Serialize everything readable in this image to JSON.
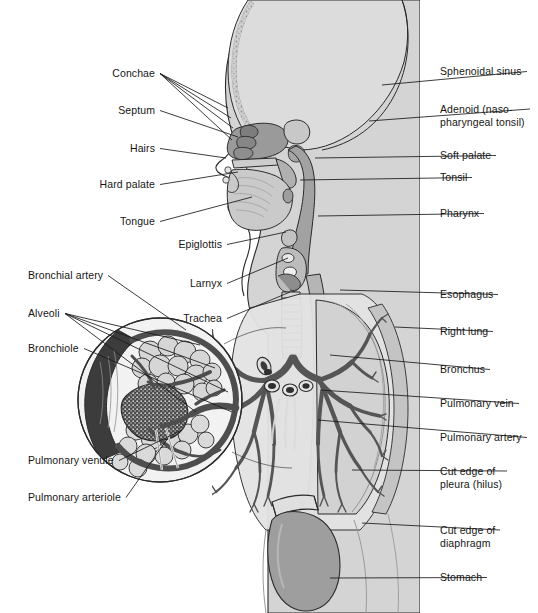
{
  "figure": {
    "background_color": "#ffffff",
    "ink_color": "#1a1a1a",
    "tissue_light": "#dcdcdc",
    "tissue_mid": "#b8b8b8",
    "tissue_dark": "#8e8e8e",
    "vessel_dark": "#5f5f5f",
    "outline_color": "#2b2b2b"
  },
  "labels_left": [
    {
      "text": "Conchae",
      "align": "right",
      "x": 155,
      "y": 76,
      "tip_x": 218,
      "tip_y": 120,
      "tips": [
        [
          228,
          108
        ],
        [
          231,
          118
        ],
        [
          233,
          128
        ],
        [
          232,
          140
        ]
      ]
    },
    {
      "text": "Septum",
      "align": "right",
      "x": 155,
      "y": 113,
      "tip_x": 226,
      "tip_y": 133,
      "tips": [
        [
          238,
          137
        ]
      ]
    },
    {
      "text": "Hairs",
      "align": "right",
      "x": 155,
      "y": 151,
      "tip_x": 232,
      "tip_y": 156,
      "tips": [
        [
          226,
          158
        ]
      ]
    },
    {
      "text": "Hard palate",
      "align": "right",
      "x": 155,
      "y": 187,
      "tip_x": 214,
      "tip_y": 189,
      "tips": [
        [
          238,
          172
        ]
      ]
    },
    {
      "text": "Tongue",
      "align": "right",
      "x": 155,
      "y": 224,
      "tip_x": 214,
      "tip_y": 221,
      "tips": [
        [
          252,
          197
        ]
      ]
    }
  ],
  "labels_inner": [
    {
      "text": "Epiglottis",
      "align": "right",
      "x": 222,
      "y": 247,
      "tips": [
        [
          286,
          232
        ]
      ]
    },
    {
      "text": "Larnyx",
      "align": "right",
      "x": 222,
      "y": 286,
      "tips": [
        [
          288,
          258
        ]
      ]
    },
    {
      "text": "Trachea",
      "align": "right",
      "x": 222,
      "y": 321,
      "tips": [
        [
          290,
          292
        ]
      ]
    }
  ],
  "labels_inset": [
    {
      "text": "Bronchial artery",
      "align": "left",
      "x": 28,
      "y": 278,
      "tips": [
        [
          186,
          330
        ]
      ]
    },
    {
      "text": "Alveoli",
      "align": "left",
      "x": 28,
      "y": 316,
      "tips": [
        [
          200,
          345
        ],
        [
          215,
          368
        ],
        [
          228,
          392
        ],
        [
          196,
          412
        ]
      ]
    },
    {
      "text": "Bronchiole",
      "align": "left",
      "x": 28,
      "y": 351,
      "tips": [
        [
          232,
          412
        ]
      ]
    },
    {
      "text": "Pulmonary venule",
      "align": "left",
      "x": 28,
      "y": 463,
      "tips": [
        [
          182,
          430
        ]
      ]
    },
    {
      "text": "Pulmonary arteriole",
      "align": "left",
      "x": 28,
      "y": 500,
      "tips": [
        [
          168,
          438
        ]
      ]
    }
  ],
  "labels_right": [
    {
      "text": "Sphenoidal sinus",
      "lines": [
        "Sphenoidal sinus"
      ],
      "x": 440,
      "y": 74,
      "tips": [
        [
          382,
          85
        ]
      ]
    },
    {
      "text": "Adenoid (naso-pharyngeal tonsil)",
      "lines": [
        "Adenoid (naso-",
        "pharyngeal tonsil)"
      ],
      "x": 440,
      "y": 112,
      "tips": [
        [
          369,
          121
        ]
      ]
    },
    {
      "text": "Soft palate",
      "lines": [
        "Soft palate"
      ],
      "x": 440,
      "y": 158,
      "tips": [
        [
          315,
          158
        ]
      ]
    },
    {
      "text": "Tonsil",
      "lines": [
        "Tonsil"
      ],
      "x": 440,
      "y": 180,
      "tips": [
        [
          300,
          180
        ]
      ]
    },
    {
      "text": "Pharynx",
      "lines": [
        "Pharynx"
      ],
      "x": 440,
      "y": 216,
      "tips": [
        [
          318,
          216
        ]
      ]
    },
    {
      "text": "Esophagus",
      "lines": [
        "Esophagus"
      ],
      "x": 440,
      "y": 297,
      "tips": [
        [
          340,
          290
        ]
      ]
    },
    {
      "text": "Right lung",
      "lines": [
        "Right lung"
      ],
      "x": 440,
      "y": 334,
      "tips": [
        [
          395,
          327
        ]
      ]
    },
    {
      "text": "Bronchus",
      "lines": [
        "Bronchus"
      ],
      "x": 440,
      "y": 372,
      "tips": [
        [
          330,
          355
        ]
      ]
    },
    {
      "text": "Pulmonary vein",
      "lines": [
        "Pulmonary vein"
      ],
      "x": 440,
      "y": 406,
      "tips": [
        [
          320,
          390
        ]
      ]
    },
    {
      "text": "Pulmonary artery",
      "lines": [
        "Pulmonary artery"
      ],
      "x": 440,
      "y": 440,
      "tips": [
        [
          318,
          420
        ]
      ]
    },
    {
      "text": "Cut edge of pleura (hilus)",
      "lines": [
        "Cut edge of",
        "pleura (hilus)"
      ],
      "x": 440,
      "y": 474,
      "tips": [
        [
          352,
          470
        ]
      ]
    },
    {
      "text": "Cut edge of diaphragm",
      "lines": [
        "Cut edge of",
        "diaphragm"
      ],
      "x": 440,
      "y": 533,
      "tips": [
        [
          362,
          523
        ]
      ]
    },
    {
      "text": "Stomach",
      "lines": [
        "Stomach"
      ],
      "x": 440,
      "y": 580,
      "tips": [
        [
          330,
          578
        ]
      ]
    }
  ],
  "caption_cut": {
    "text": ""
  }
}
